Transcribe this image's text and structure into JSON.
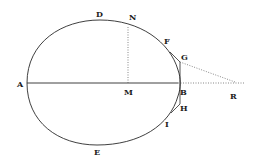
{
  "diagram": {
    "colors": {
      "stroke": "#2a2a2a",
      "background": "#ffffff"
    },
    "labels": {
      "A": "A",
      "B": "B",
      "D": "D",
      "E": "E",
      "F": "F",
      "G": "G",
      "H": "H",
      "I": "I",
      "M": "M",
      "N": "N",
      "R": "R"
    },
    "points": {
      "A": [
        27,
        83
      ],
      "B": [
        178,
        83
      ],
      "M": [
        128,
        83
      ],
      "N": [
        128,
        27
      ],
      "D": [
        100,
        20
      ],
      "E": [
        97,
        145
      ],
      "F": [
        170,
        52
      ],
      "G": [
        180,
        62
      ],
      "H": [
        180,
        104
      ],
      "I": [
        171,
        113
      ],
      "R": [
        235,
        83
      ]
    },
    "lines": [
      {
        "from": "A",
        "to": "B",
        "style": "solid"
      },
      {
        "from": "M",
        "to": "N",
        "style": "dotted"
      },
      {
        "from": "G",
        "to": "R",
        "style": "dotted"
      },
      {
        "from": "B",
        "to": "R",
        "style": "dotted"
      },
      {
        "from": "F",
        "to": "G",
        "style": "solid"
      },
      {
        "from": "G",
        "to": "H",
        "style": "solid"
      },
      {
        "from": "H",
        "to": "I",
        "style": "solid"
      }
    ]
  }
}
